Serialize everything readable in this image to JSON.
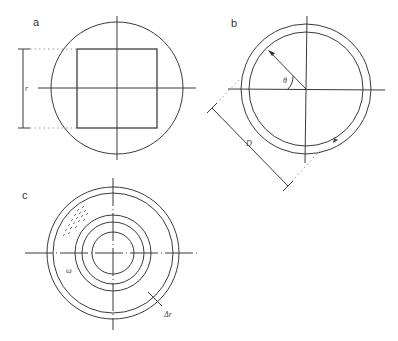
{
  "figure": {
    "panels": [
      {
        "id": "a",
        "label": "a",
        "description": "Square inscribed within a circle with crosshair axes; vertical dimension line labeled r",
        "dimension_label": "r"
      },
      {
        "id": "b",
        "label": "b",
        "description": "Annular ring (two concentric circles) with crosshair axes; radial arrow at angle theta; diagonal dimension line labeled D",
        "angle_label": "θ",
        "dimension_label": "D"
      },
      {
        "id": "c",
        "label": "c",
        "description": "Disc with outer annulus and three inner concentric rings; dotted shading in upper-left; small marker near left; radial tick labeled Δr",
        "marker_label": "ω",
        "dimension_label": "Δr"
      }
    ]
  }
}
